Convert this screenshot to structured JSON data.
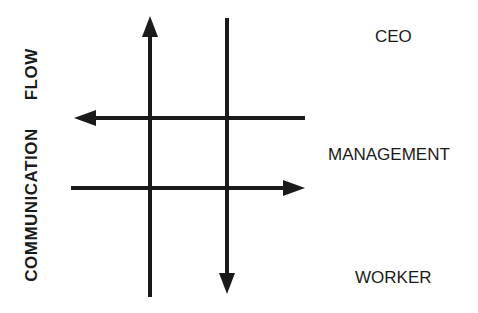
{
  "diagram": {
    "axis_label": {
      "word1": "COMMUNICATION",
      "word2": "FLOW"
    },
    "levels": [
      {
        "label": "CEO"
      },
      {
        "label": "MANAGEMENT"
      },
      {
        "label": "WORKER"
      }
    ],
    "arrows": [
      {
        "direction": "up",
        "description": "upward communication"
      },
      {
        "direction": "down",
        "description": "downward communication"
      },
      {
        "direction": "left",
        "description": "horizontal communication (upper)"
      },
      {
        "direction": "right",
        "description": "horizontal communication (lower)"
      }
    ],
    "colors": {
      "stroke": "#1a1a1a",
      "text": "#1a1a1a",
      "background": "#ffffff"
    }
  }
}
